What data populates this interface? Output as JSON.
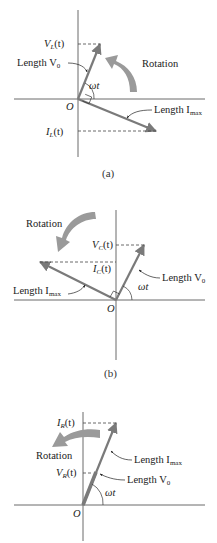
{
  "figure": {
    "panels": [
      {
        "id": "a",
        "caption": "(a)",
        "rotation_label": "Rotation",
        "vertical_label": "V",
        "vertical_sub": "L",
        "vertical_suffix": "(t)",
        "lower_label": "I",
        "lower_sub": "L",
        "lower_suffix": "(t)",
        "length_v_label": "Length V",
        "length_v_sub": "0",
        "length_i_label": "Length I",
        "length_i_sub": "max",
        "angle_label": "ωt",
        "origin_label": "O"
      },
      {
        "id": "b",
        "caption": "(b)",
        "rotation_label": "Rotation",
        "upper_label": "V",
        "upper_sub": "C",
        "upper_suffix": "(t)",
        "lower_label": "I",
        "lower_sub": "C",
        "lower_suffix": "(t)",
        "length_v_label": "Length V",
        "length_v_sub": "0",
        "length_i_label": "Length I",
        "length_i_sub": "max",
        "angle_label": "ωt",
        "origin_label": "O"
      },
      {
        "id": "c",
        "caption": "",
        "rotation_label": "Rotation",
        "upper_label": "I",
        "upper_sub": "R",
        "upper_suffix": "(t)",
        "lower_label": "V",
        "lower_sub": "R",
        "lower_suffix": "(t)",
        "length_i_label": "Length I",
        "length_i_sub": "max",
        "length_v_label": "Length V",
        "length_v_sub": "0",
        "angle_label": "ωt",
        "origin_label": "O"
      }
    ],
    "colors": {
      "phasor": "#7a7a7a",
      "rotation_arrow": "#9a9a9a",
      "axis": "#6a6a6a",
      "text": "#222222"
    }
  }
}
